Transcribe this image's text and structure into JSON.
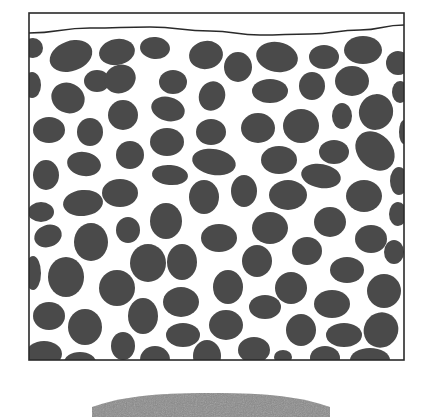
{
  "diagram": {
    "title": "",
    "colors": {
      "background": "#ffffff",
      "outline": "#2a2a2a",
      "particle": "#4a4a4a",
      "mound": "#8a8a8a"
    },
    "container": {
      "x": 29,
      "y": 13,
      "width": 375,
      "height": 347
    },
    "surface_line": {
      "points": [
        [
          29,
          33
        ],
        [
          90,
          28
        ],
        [
          150,
          27
        ],
        [
          210,
          31
        ],
        [
          260,
          35
        ],
        [
          310,
          34
        ],
        [
          360,
          30
        ],
        [
          404,
          25
        ]
      ]
    },
    "particles": [
      {
        "cx": 33,
        "cy": 48,
        "rx": 10,
        "ry": 10,
        "rot": 0
      },
      {
        "cx": 71,
        "cy": 56,
        "rx": 22,
        "ry": 15,
        "rot": -20
      },
      {
        "cx": 117,
        "cy": 52,
        "rx": 18,
        "ry": 13,
        "rot": -10
      },
      {
        "cx": 155,
        "cy": 48,
        "rx": 15,
        "ry": 11,
        "rot": 5
      },
      {
        "cx": 206,
        "cy": 55,
        "rx": 17,
        "ry": 14,
        "rot": -10
      },
      {
        "cx": 238,
        "cy": 67,
        "rx": 14,
        "ry": 15,
        "rot": 0
      },
      {
        "cx": 277,
        "cy": 57,
        "rx": 21,
        "ry": 15,
        "rot": 10
      },
      {
        "cx": 324,
        "cy": 57,
        "rx": 15,
        "ry": 12,
        "rot": 0
      },
      {
        "cx": 363,
        "cy": 50,
        "rx": 19,
        "ry": 14,
        "rot": 0
      },
      {
        "cx": 398,
        "cy": 63,
        "rx": 12,
        "ry": 12,
        "rot": 0
      },
      {
        "cx": 32,
        "cy": 85,
        "rx": 9,
        "ry": 13,
        "rot": 0
      },
      {
        "cx": 97,
        "cy": 81,
        "rx": 13,
        "ry": 11,
        "rot": 0
      },
      {
        "cx": 120,
        "cy": 79,
        "rx": 16,
        "ry": 14,
        "rot": -25
      },
      {
        "cx": 173,
        "cy": 82,
        "rx": 14,
        "ry": 12,
        "rot": 0
      },
      {
        "cx": 212,
        "cy": 96,
        "rx": 13,
        "ry": 15,
        "rot": 20
      },
      {
        "cx": 270,
        "cy": 91,
        "rx": 18,
        "ry": 12,
        "rot": 0
      },
      {
        "cx": 312,
        "cy": 86,
        "rx": 13,
        "ry": 14,
        "rot": 0
      },
      {
        "cx": 352,
        "cy": 81,
        "rx": 17,
        "ry": 15,
        "rot": 0
      },
      {
        "cx": 400,
        "cy": 92,
        "rx": 8,
        "ry": 11,
        "rot": 0
      },
      {
        "cx": 68,
        "cy": 98,
        "rx": 17,
        "ry": 15,
        "rot": 25
      },
      {
        "cx": 123,
        "cy": 115,
        "rx": 15,
        "ry": 15,
        "rot": 0
      },
      {
        "cx": 168,
        "cy": 109,
        "rx": 17,
        "ry": 12,
        "rot": 15
      },
      {
        "cx": 258,
        "cy": 128,
        "rx": 17,
        "ry": 15,
        "rot": 0
      },
      {
        "cx": 301,
        "cy": 126,
        "rx": 18,
        "ry": 17,
        "rot": 0
      },
      {
        "cx": 342,
        "cy": 116,
        "rx": 10,
        "ry": 13,
        "rot": 0
      },
      {
        "cx": 376,
        "cy": 112,
        "rx": 17,
        "ry": 18,
        "rot": 20
      },
      {
        "cx": 404,
        "cy": 132,
        "rx": 5,
        "ry": 12,
        "rot": 0
      },
      {
        "cx": 49,
        "cy": 130,
        "rx": 16,
        "ry": 13,
        "rot": 0
      },
      {
        "cx": 90,
        "cy": 132,
        "rx": 13,
        "ry": 14,
        "rot": 0
      },
      {
        "cx": 211,
        "cy": 132,
        "rx": 15,
        "ry": 13,
        "rot": 0
      },
      {
        "cx": 167,
        "cy": 142,
        "rx": 17,
        "ry": 14,
        "rot": 0
      },
      {
        "cx": 130,
        "cy": 155,
        "rx": 14,
        "ry": 14,
        "rot": 0
      },
      {
        "cx": 214,
        "cy": 162,
        "rx": 22,
        "ry": 13,
        "rot": 10
      },
      {
        "cx": 279,
        "cy": 160,
        "rx": 18,
        "ry": 14,
        "rot": 0
      },
      {
        "cx": 334,
        "cy": 152,
        "rx": 15,
        "ry": 12,
        "rot": 0
      },
      {
        "cx": 375,
        "cy": 151,
        "rx": 22,
        "ry": 17,
        "rot": 45
      },
      {
        "cx": 84,
        "cy": 164,
        "rx": 17,
        "ry": 12,
        "rot": 10
      },
      {
        "cx": 46,
        "cy": 175,
        "rx": 13,
        "ry": 15,
        "rot": 0
      },
      {
        "cx": 170,
        "cy": 175,
        "rx": 18,
        "ry": 10,
        "rot": 5
      },
      {
        "cx": 321,
        "cy": 176,
        "rx": 20,
        "ry": 12,
        "rot": 10
      },
      {
        "cx": 399,
        "cy": 181,
        "rx": 9,
        "ry": 14,
        "rot": 0
      },
      {
        "cx": 120,
        "cy": 193,
        "rx": 18,
        "ry": 14,
        "rot": 0
      },
      {
        "cx": 83,
        "cy": 203,
        "rx": 20,
        "ry": 13,
        "rot": -5
      },
      {
        "cx": 204,
        "cy": 197,
        "rx": 15,
        "ry": 17,
        "rot": 0
      },
      {
        "cx": 244,
        "cy": 191,
        "rx": 13,
        "ry": 16,
        "rot": 0
      },
      {
        "cx": 288,
        "cy": 195,
        "rx": 19,
        "ry": 15,
        "rot": 0
      },
      {
        "cx": 364,
        "cy": 196,
        "rx": 18,
        "ry": 16,
        "rot": 0
      },
      {
        "cx": 41,
        "cy": 212,
        "rx": 13,
        "ry": 10,
        "rot": 0
      },
      {
        "cx": 398,
        "cy": 214,
        "rx": 9,
        "ry": 12,
        "rot": 0
      },
      {
        "cx": 166,
        "cy": 221,
        "rx": 16,
        "ry": 18,
        "rot": 0
      },
      {
        "cx": 128,
        "cy": 230,
        "rx": 12,
        "ry": 13,
        "rot": 0
      },
      {
        "cx": 48,
        "cy": 236,
        "rx": 14,
        "ry": 11,
        "rot": -20
      },
      {
        "cx": 91,
        "cy": 242,
        "rx": 17,
        "ry": 19,
        "rot": 0
      },
      {
        "cx": 219,
        "cy": 238,
        "rx": 18,
        "ry": 14,
        "rot": 0
      },
      {
        "cx": 270,
        "cy": 228,
        "rx": 18,
        "ry": 16,
        "rot": 0
      },
      {
        "cx": 330,
        "cy": 222,
        "rx": 16,
        "ry": 15,
        "rot": 0
      },
      {
        "cx": 371,
        "cy": 239,
        "rx": 16,
        "ry": 14,
        "rot": 0
      },
      {
        "cx": 307,
        "cy": 251,
        "rx": 15,
        "ry": 14,
        "rot": 0
      },
      {
        "cx": 394,
        "cy": 252,
        "rx": 10,
        "ry": 12,
        "rot": 0
      },
      {
        "cx": 33,
        "cy": 273,
        "rx": 8,
        "ry": 17,
        "rot": 0
      },
      {
        "cx": 66,
        "cy": 277,
        "rx": 18,
        "ry": 20,
        "rot": 0
      },
      {
        "cx": 148,
        "cy": 263,
        "rx": 18,
        "ry": 19,
        "rot": 0
      },
      {
        "cx": 182,
        "cy": 262,
        "rx": 15,
        "ry": 18,
        "rot": 0
      },
      {
        "cx": 257,
        "cy": 261,
        "rx": 15,
        "ry": 16,
        "rot": 0
      },
      {
        "cx": 347,
        "cy": 270,
        "rx": 17,
        "ry": 13,
        "rot": 0
      },
      {
        "cx": 117,
        "cy": 288,
        "rx": 18,
        "ry": 18,
        "rot": 0
      },
      {
        "cx": 228,
        "cy": 287,
        "rx": 15,
        "ry": 17,
        "rot": 0
      },
      {
        "cx": 291,
        "cy": 288,
        "rx": 16,
        "ry": 16,
        "rot": 0
      },
      {
        "cx": 384,
        "cy": 291,
        "rx": 17,
        "ry": 17,
        "rot": 0
      },
      {
        "cx": 181,
        "cy": 302,
        "rx": 18,
        "ry": 15,
        "rot": 0
      },
      {
        "cx": 332,
        "cy": 304,
        "rx": 18,
        "ry": 14,
        "rot": 0
      },
      {
        "cx": 265,
        "cy": 307,
        "rx": 16,
        "ry": 12,
        "rot": 0
      },
      {
        "cx": 49,
        "cy": 316,
        "rx": 16,
        "ry": 14,
        "rot": 0
      },
      {
        "cx": 143,
        "cy": 316,
        "rx": 15,
        "ry": 18,
        "rot": 0
      },
      {
        "cx": 85,
        "cy": 327,
        "rx": 17,
        "ry": 18,
        "rot": 0
      },
      {
        "cx": 226,
        "cy": 325,
        "rx": 17,
        "ry": 15,
        "rot": 0
      },
      {
        "cx": 301,
        "cy": 330,
        "rx": 15,
        "ry": 16,
        "rot": 0
      },
      {
        "cx": 381,
        "cy": 330,
        "rx": 17,
        "ry": 18,
        "rot": 35
      },
      {
        "cx": 183,
        "cy": 335,
        "rx": 17,
        "ry": 12,
        "rot": 0
      },
      {
        "cx": 344,
        "cy": 335,
        "rx": 18,
        "ry": 12,
        "rot": 0
      },
      {
        "cx": 123,
        "cy": 346,
        "rx": 12,
        "ry": 14,
        "rot": 0
      },
      {
        "cx": 44,
        "cy": 354,
        "rx": 18,
        "ry": 13,
        "rot": 0
      },
      {
        "cx": 80,
        "cy": 362,
        "rx": 16,
        "ry": 10,
        "rot": 0
      },
      {
        "cx": 155,
        "cy": 360,
        "rx": 15,
        "ry": 14,
        "rot": 0
      },
      {
        "cx": 207,
        "cy": 356,
        "rx": 14,
        "ry": 16,
        "rot": 0
      },
      {
        "cx": 254,
        "cy": 350,
        "rx": 16,
        "ry": 13,
        "rot": 0
      },
      {
        "cx": 283,
        "cy": 357,
        "rx": 9,
        "ry": 7,
        "rot": 0
      },
      {
        "cx": 325,
        "cy": 358,
        "rx": 15,
        "ry": 12,
        "rot": 0
      },
      {
        "cx": 370,
        "cy": 360,
        "rx": 20,
        "ry": 12,
        "rot": 0
      }
    ],
    "mound": {
      "x1": 92,
      "x2": 330,
      "top": 393,
      "side_y": 407,
      "bottom": 417
    }
  }
}
